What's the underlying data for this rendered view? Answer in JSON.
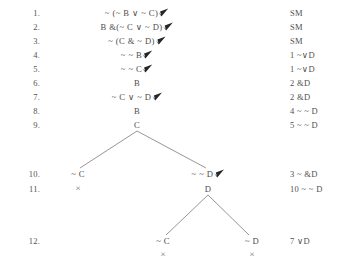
{
  "document": {
    "type": "semantic-tableau-truth-tree",
    "columns": {
      "line_number_header": "",
      "formula_header": "",
      "justification_header": ""
    }
  },
  "lines": [
    {
      "number": "1.",
      "formula": "~ (~ B ∨ ~ C)",
      "checked": true,
      "justification": "SM",
      "x": 137,
      "y": 14
    },
    {
      "number": "2.",
      "formula": "B &(~ C ∨ ~ D)",
      "checked": true,
      "justification": "SM",
      "x": 137,
      "y": 28
    },
    {
      "number": "3.",
      "formula": "~ (C & ~ D)",
      "checked": true,
      "justification": "SM",
      "x": 137,
      "y": 42
    },
    {
      "number": "4.",
      "formula": "~ ~ B",
      "checked": true,
      "justification": "1 ~∨D",
      "x": 137,
      "y": 56
    },
    {
      "number": "5.",
      "formula": "~ ~ C",
      "checked": true,
      "justification": "1 ~∨D",
      "x": 137,
      "y": 70
    },
    {
      "number": "6.",
      "formula": "B",
      "checked": false,
      "justification": "2 &D",
      "x": 137,
      "y": 84
    },
    {
      "number": "7.",
      "formula": "~ C ∨ ~ D",
      "checked": true,
      "justification": "2 &D",
      "x": 137,
      "y": 98
    },
    {
      "number": "8.",
      "formula": "B",
      "checked": false,
      "justification": "4 ~ ~ D",
      "x": 137,
      "y": 112
    },
    {
      "number": "9.",
      "formula": "C",
      "checked": false,
      "justification": "5 ~ ~ D",
      "x": 137,
      "y": 126
    },
    {
      "number": "10.",
      "formula": "",
      "checked": false,
      "justification": "3 ~ &D",
      "x": 137,
      "y": 175
    },
    {
      "number": "11.",
      "formula": "",
      "checked": false,
      "justification": "10 ~ ~ D",
      "x": 137,
      "y": 190
    },
    {
      "number": "12.",
      "formula": "",
      "checked": false,
      "justification": "7 ∨D",
      "x": 137,
      "y": 242
    }
  ],
  "branch_nodes": [
    {
      "id": "node-10-left",
      "formula": "~ C",
      "checked": false,
      "closed": true,
      "closure_mark": "×",
      "x": 78,
      "y": 175,
      "closure_y": 190
    },
    {
      "id": "node-10-right",
      "formula": "~ ~ D",
      "checked": true,
      "closed": false,
      "closure_mark": "",
      "x": 208,
      "y": 175,
      "closure_y": 0
    },
    {
      "id": "node-11-right",
      "formula": "D",
      "checked": false,
      "closed": false,
      "closure_mark": "",
      "x": 208,
      "y": 190,
      "closure_y": 0
    },
    {
      "id": "node-12-left",
      "formula": "~ C",
      "closed": true,
      "checked": false,
      "closure_mark": "×",
      "x": 163,
      "y": 242,
      "closure_y": 256
    },
    {
      "id": "node-12-right",
      "formula": "~ D",
      "closed": true,
      "checked": false,
      "closure_mark": "×",
      "x": 252,
      "y": 242,
      "closure_y": 256
    }
  ],
  "branch_edges": [
    {
      "id": "edge-c-to-notc",
      "x1": 137,
      "y1": 131,
      "x2": 80,
      "y2": 168
    },
    {
      "id": "edge-c-to-notnotd",
      "x1": 137,
      "y1": 131,
      "x2": 206,
      "y2": 168
    },
    {
      "id": "edge-d-to-notc",
      "x1": 208,
      "y1": 195,
      "x2": 166,
      "y2": 235
    },
    {
      "id": "edge-d-to-notd",
      "x1": 208,
      "y1": 195,
      "x2": 249,
      "y2": 235
    }
  ],
  "style": {
    "ink": "#4f4c4c",
    "rule_line": "#7d7a7a",
    "paper": "#ffffff",
    "justification_x": 290,
    "line_number_x": 18
  }
}
